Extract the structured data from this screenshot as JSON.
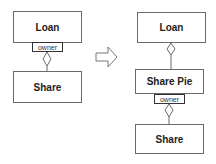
{
  "left": {
    "top_class": "Loan",
    "qualifier": "owner",
    "bottom_class": "Share"
  },
  "arrow": "hollow-right-arrow",
  "right": {
    "top_class": "Loan",
    "middle_class": "Share Pie",
    "qualifier": "owner",
    "bottom_class": "Share"
  },
  "colors": {
    "line": "#6a6a6a",
    "background": "#ffffff",
    "text": "#222222"
  }
}
